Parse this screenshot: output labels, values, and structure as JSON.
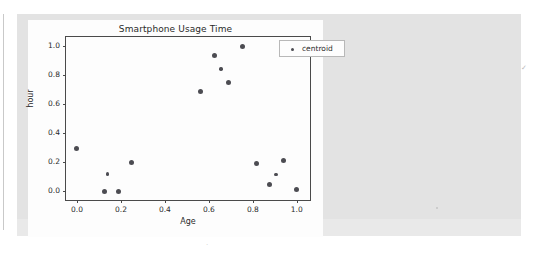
{
  "page": {
    "background_color": "#ffffff",
    "panel_color": "#e3e3e3",
    "card_color": "#fdfdfd"
  },
  "legend": {
    "label": "centroid",
    "position": "upper right",
    "marker_color": "#4c4c52"
  },
  "chart_data": {
    "type": "scatter",
    "title": "Smartphone Usage Time",
    "xlabel": "Age",
    "ylabel": "hour",
    "xlim": [
      -0.05,
      1.06
    ],
    "ylim": [
      -0.06,
      1.06
    ],
    "xticks": [
      0.0,
      0.2,
      0.4,
      0.6,
      0.8,
      1.0
    ],
    "yticks": [
      0.0,
      0.2,
      0.4,
      0.6,
      0.8,
      1.0
    ],
    "xticklabels": [
      "0.0",
      "0.2",
      "0.4",
      "0.6",
      "0.8",
      "1.0"
    ],
    "yticklabels": [
      "0.0",
      "0.2",
      "0.4",
      "0.6",
      "0.8",
      "1.0"
    ],
    "grid": false,
    "legend_position": "upper right",
    "series": [
      {
        "name": "centroid",
        "color": "#4c4c52",
        "marker": "o",
        "points": [
          {
            "x": 0.0,
            "y": 0.295,
            "size": "normal"
          },
          {
            "x": 0.14,
            "y": 0.12,
            "size": "small"
          },
          {
            "x": 0.125,
            "y": 0.0,
            "size": "normal"
          },
          {
            "x": 0.19,
            "y": 0.0,
            "size": "normal"
          },
          {
            "x": 0.25,
            "y": 0.2,
            "size": "normal"
          },
          {
            "x": 0.56,
            "y": 0.685,
            "size": "normal"
          },
          {
            "x": 0.625,
            "y": 0.935,
            "size": "normal"
          },
          {
            "x": 0.655,
            "y": 0.84,
            "size": "small"
          },
          {
            "x": 0.69,
            "y": 0.75,
            "size": "normal"
          },
          {
            "x": 0.755,
            "y": 0.995,
            "size": "normal"
          },
          {
            "x": 0.815,
            "y": 0.19,
            "size": "normal"
          },
          {
            "x": 0.875,
            "y": 0.045,
            "size": "normal"
          },
          {
            "x": 0.905,
            "y": 0.115,
            "size": "small"
          },
          {
            "x": 0.94,
            "y": 0.21,
            "size": "normal"
          },
          {
            "x": 1.0,
            "y": 0.015,
            "size": "normal"
          }
        ]
      }
    ]
  }
}
